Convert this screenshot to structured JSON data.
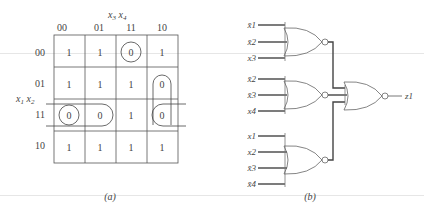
{
  "kmap": {
    "col_var_label": "x3x4",
    "row_var_label": "x1x2",
    "col_headers": [
      "00",
      "01",
      "11",
      "10"
    ],
    "row_headers": [
      "00",
      "01",
      "11",
      "10"
    ],
    "cells": [
      [
        "1",
        "1",
        "0",
        "1"
      ],
      [
        "1",
        "1",
        "1",
        "0"
      ],
      [
        "0",
        "0",
        "1",
        "0"
      ],
      [
        "1",
        "1",
        "1",
        "1"
      ]
    ],
    "groupings": [
      {
        "description": "single circle around cell (00,11)",
        "cells": [
          [
            0,
            2
          ]
        ]
      },
      {
        "description": "vertical loop covering (01,10) and (11,10)",
        "cells": [
          [
            1,
            3
          ],
          [
            2,
            3
          ]
        ]
      },
      {
        "description": "horizontal loop covering (11,00),(11,01) and wrapping to (11,10)",
        "cells": [
          [
            2,
            0
          ],
          [
            2,
            1
          ],
          [
            2,
            3
          ]
        ]
      },
      {
        "description": "circle around cell (11,00)",
        "cells": [
          [
            2,
            0
          ]
        ]
      }
    ],
    "caption": "(a)"
  },
  "circuit": {
    "gates": [
      {
        "type": "NOR",
        "inputs": [
          "x̄1",
          "x̄2",
          "x3"
        ]
      },
      {
        "type": "NOR",
        "inputs": [
          "x̄2",
          "x̄3",
          "x4"
        ]
      },
      {
        "type": "NOR",
        "inputs": [
          "x1",
          "x2",
          "x̄3",
          "x̄4"
        ]
      },
      {
        "type": "NOR",
        "inputs": [
          "g1",
          "g2",
          "g3"
        ],
        "output": "z1"
      }
    ],
    "labels": {
      "g1_in": [
        "x̄1",
        "x̄2",
        "x3"
      ],
      "g2_in": [
        "x̄2",
        "x̄3",
        "x4"
      ],
      "g3_in": [
        "x1",
        "x2",
        "x̄3",
        "x̄4"
      ],
      "output": "z1"
    },
    "caption": "(b)"
  }
}
